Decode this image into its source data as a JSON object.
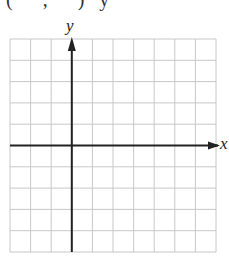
{
  "header": {
    "cropped_text": "(      ,      )   y"
  },
  "graph": {
    "x_label": "x",
    "y_label": "y",
    "columns": 10,
    "rows": 10,
    "y_axis_column": 3,
    "x_axis_row": 5,
    "grid_color": "#c8c8c8",
    "axis_color": "#222222"
  }
}
